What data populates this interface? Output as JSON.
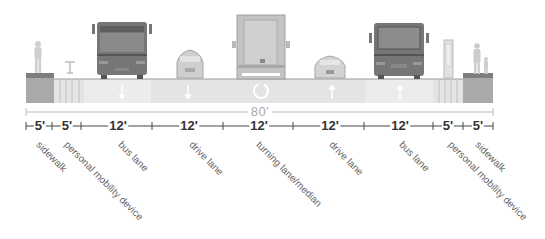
{
  "diagram": {
    "type": "street-cross-section",
    "total_width_label": "80'",
    "segments": [
      {
        "width": "5'",
        "label": "sidewalk"
      },
      {
        "width": "5'",
        "label": "personal mobility device"
      },
      {
        "width": "12'",
        "label": "bus lane"
      },
      {
        "width": "12'",
        "label": "drive lane"
      },
      {
        "width": "12'",
        "label": "turning lane/median"
      },
      {
        "width": "12'",
        "label": "drive lane"
      },
      {
        "width": "12'",
        "label": "bus lane"
      },
      {
        "width": "5'",
        "label": "personal mobility device"
      },
      {
        "width": "5'",
        "label": "sidewalk"
      }
    ],
    "vehicles": [
      "pedestrian",
      "scooter",
      "bus",
      "car",
      "truck",
      "car",
      "bus",
      "kiosk",
      "pedestrians-with-child"
    ],
    "lane_markings": [
      "arrow-down",
      "arrow-down",
      "turn-circle",
      "arrow-up",
      "arrow-up"
    ],
    "colors": {
      "sidewalk": "#a8a8a8",
      "road": "#e4e4e4",
      "vehicle": "#6e6e6e",
      "dimension_line": "#444444",
      "total_line": "#c8c8c8"
    }
  }
}
